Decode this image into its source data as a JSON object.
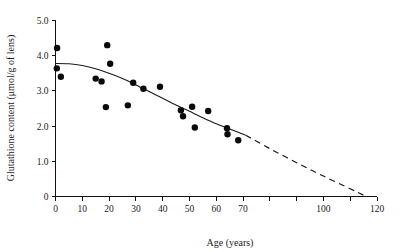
{
  "chart_data": {
    "type": "scatter",
    "title": "",
    "xlabel": "Age (years)",
    "ylabel": "Glutathione content (μmol/g of lens)",
    "xlim": [
      0,
      120
    ],
    "ylim": [
      0,
      5.0
    ],
    "grid": false,
    "legend": "none",
    "x_ticks": [
      0,
      10,
      20,
      30,
      40,
      50,
      60,
      70,
      80,
      90,
      100,
      110,
      120
    ],
    "x_tick_labels": [
      "0",
      "10",
      "20",
      "30",
      "40",
      "50",
      "60",
      "70",
      "",
      "",
      "100",
      "",
      "120"
    ],
    "y_ticks": [
      0,
      1.0,
      2.0,
      3.0,
      4.0,
      5.0
    ],
    "y_tick_labels": [
      "0",
      "1.0",
      "2.0",
      "3.0",
      "4.0",
      "5.0"
    ],
    "series": [
      {
        "name": "Lens glutathione measurements",
        "marker": "filled-circle",
        "color": "#0a0a0a",
        "points": [
          {
            "x": 0.6,
            "y": 4.22
          },
          {
            "x": 0.5,
            "y": 3.64
          },
          {
            "x": 2.0,
            "y": 3.4
          },
          {
            "x": 15.0,
            "y": 3.35
          },
          {
            "x": 17.2,
            "y": 3.27
          },
          {
            "x": 18.8,
            "y": 2.54
          },
          {
            "x": 19.3,
            "y": 4.3
          },
          {
            "x": 20.4,
            "y": 3.77
          },
          {
            "x": 27.0,
            "y": 2.59
          },
          {
            "x": 29.0,
            "y": 3.23
          },
          {
            "x": 32.8,
            "y": 3.06
          },
          {
            "x": 39.0,
            "y": 3.12
          },
          {
            "x": 46.8,
            "y": 2.45
          },
          {
            "x": 47.6,
            "y": 2.28
          },
          {
            "x": 51.0,
            "y": 2.55
          },
          {
            "x": 52.0,
            "y": 1.96
          },
          {
            "x": 57.0,
            "y": 2.43
          },
          {
            "x": 64.0,
            "y": 1.94
          },
          {
            "x": 64.2,
            "y": 1.77
          },
          {
            "x": 68.2,
            "y": 1.6
          }
        ]
      }
    ],
    "fit_curve": {
      "name": "Fitted trend",
      "solid_range": [
        0,
        71
      ],
      "dashed_range": [
        71,
        116
      ],
      "solid_points": [
        {
          "x": 0,
          "y": 3.78
        },
        {
          "x": 5,
          "y": 3.77
        },
        {
          "x": 10,
          "y": 3.72
        },
        {
          "x": 15,
          "y": 3.63
        },
        {
          "x": 20,
          "y": 3.5
        },
        {
          "x": 25,
          "y": 3.35
        },
        {
          "x": 30,
          "y": 3.17
        },
        {
          "x": 35,
          "y": 2.98
        },
        {
          "x": 40,
          "y": 2.79
        },
        {
          "x": 45,
          "y": 2.6
        },
        {
          "x": 50,
          "y": 2.42
        },
        {
          "x": 55,
          "y": 2.24
        },
        {
          "x": 60,
          "y": 2.07
        },
        {
          "x": 65,
          "y": 1.92
        },
        {
          "x": 71,
          "y": 1.74
        }
      ],
      "dashed_points": [
        {
          "x": 71,
          "y": 1.74
        },
        {
          "x": 80,
          "y": 1.36
        },
        {
          "x": 90,
          "y": 0.96
        },
        {
          "x": 100,
          "y": 0.58
        },
        {
          "x": 110,
          "y": 0.22
        },
        {
          "x": 116,
          "y": 0.0
        }
      ]
    }
  }
}
